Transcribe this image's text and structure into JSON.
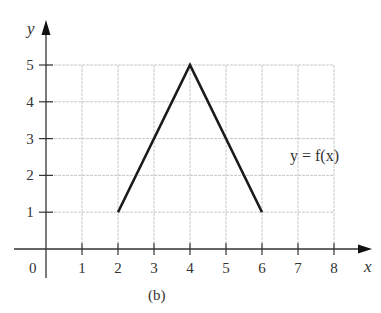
{
  "chart_data": {
    "type": "line",
    "title": "",
    "caption": "(b)",
    "xlabel": "x",
    "ylabel": "y",
    "x_ticks": [
      "1",
      "2",
      "3",
      "4",
      "5",
      "6",
      "7",
      "8"
    ],
    "y_ticks": [
      "1",
      "2",
      "3",
      "4",
      "5"
    ],
    "origin_label": "0",
    "xlim": [
      0,
      8
    ],
    "ylim": [
      0,
      5
    ],
    "grid": true,
    "series": [
      {
        "name": "y = f(x)",
        "x": [
          2,
          4,
          6
        ],
        "y": [
          1,
          5,
          1
        ]
      }
    ],
    "annotations": [
      {
        "text": "y = f(x)",
        "x": 7.1,
        "y": 2.5
      }
    ],
    "colors": {
      "line": "#1a1a1a",
      "grid": "#c8c8c8",
      "axis": "#333333"
    }
  }
}
